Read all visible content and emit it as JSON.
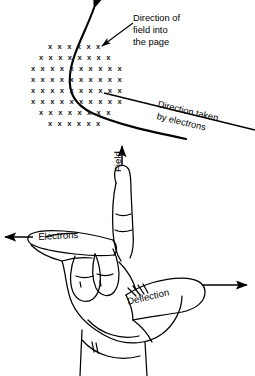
{
  "figure": {
    "background_color": "#ffffff",
    "ink_color": "#000000",
    "width": 255,
    "height": 376
  },
  "top_diagram": {
    "field_region": {
      "symbol": "x",
      "meaning": "field-into-page",
      "rows": [
        {
          "count": 6,
          "x_start": 48,
          "y": 43,
          "step": 9.6
        },
        {
          "count": 8,
          "x_start": 39,
          "y": 54,
          "step": 9.6
        },
        {
          "count": 10,
          "x_start": 31,
          "y": 65,
          "step": 9.6
        },
        {
          "count": 10,
          "x_start": 31,
          "y": 76,
          "step": 9.6
        },
        {
          "count": 10,
          "x_start": 31,
          "y": 87,
          "step": 9.6
        },
        {
          "count": 10,
          "x_start": 31,
          "y": 98,
          "step": 9.6
        },
        {
          "count": 8,
          "x_start": 39,
          "y": 109,
          "step": 9.6
        },
        {
          "count": 6,
          "x_start": 48,
          "y": 120,
          "step": 9.6
        }
      ]
    },
    "labels": {
      "field_into_page": {
        "line1": "Direction of",
        "line2": "field into",
        "line3": "the page"
      },
      "direction_taken": {
        "line1": "Direction taken",
        "line2": "by electrons"
      }
    }
  },
  "hand_diagram": {
    "labels": {
      "field": "Field",
      "electrons": "Electrons",
      "deflection": "Deflection"
    },
    "arrows": {
      "field_direction": "up",
      "electrons_direction": "left",
      "deflection_direction": "right"
    }
  }
}
